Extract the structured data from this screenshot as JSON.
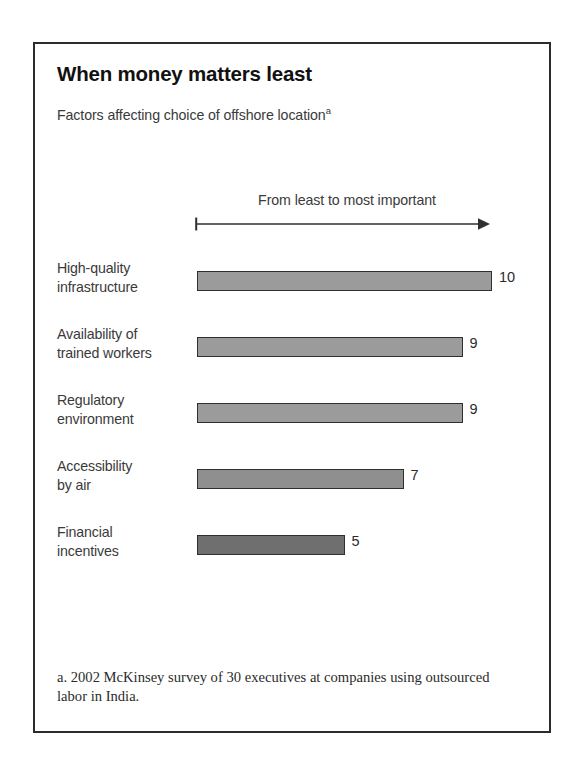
{
  "exhibit": {
    "title": "When money matters least",
    "subtitle": "Factors affecting choice of offshore location",
    "subtitle_footnote_marker": "a",
    "axis_caption": "From least to most important",
    "footnote": "a. 2002 McKinsey survey of 30 executives at companies using outsourced labor in India."
  },
  "chart_data": {
    "type": "bar",
    "orientation": "horizontal",
    "title": "When money matters least",
    "subtitle": "Factors affecting choice of offshore location",
    "xlabel": "From least to most important",
    "ylabel": "",
    "xlim": [
      0,
      10
    ],
    "grid": false,
    "legend": null,
    "categories": [
      "High-quality infrastructure",
      "Availability of trained workers",
      "Regulatory environment",
      "Accessibility by air",
      "Financial incentives"
    ],
    "values": [
      10,
      9,
      9,
      7,
      5
    ],
    "value_labels": [
      "10",
      "9",
      "9",
      "7",
      "5"
    ],
    "bars": [
      {
        "label_line1": "High-quality",
        "label_line2": "infrastructure",
        "value": 10,
        "value_label": "10",
        "color": "#9b9b9b"
      },
      {
        "label_line1": "Availability of",
        "label_line2": "trained workers",
        "value": 9,
        "value_label": "9",
        "color": "#9b9b9b"
      },
      {
        "label_line1": "Regulatory",
        "label_line2": "environment",
        "value": 9,
        "value_label": "9",
        "color": "#9b9b9b"
      },
      {
        "label_line1": "Accessibility",
        "label_line2": "by air",
        "value": 7,
        "value_label": "7",
        "color": "#8f8f8f"
      },
      {
        "label_line1": "Financial",
        "label_line2": "incentives",
        "value": 5,
        "value_label": "5",
        "color": "#6f6f6f"
      }
    ],
    "annotations": [
      "From least to most important"
    ]
  },
  "colors": {
    "frame": "#2b2b2b",
    "bar_outline": "#2f2f2f",
    "bar_fill_light": "#9b9b9b",
    "bar_fill_dark": "#6f6f6f",
    "text": "#3a3a3a",
    "background": "#ffffff"
  }
}
